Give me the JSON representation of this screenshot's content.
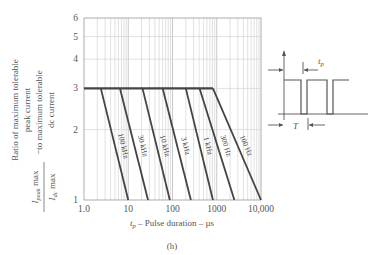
{
  "chart_data": {
    "type": "line",
    "title": "",
    "caption": "(h)",
    "xlabel": "t_p – Pulse duration – µs",
    "ylabel": "Ratio of maximum tolerable peak current to maximum tolerable dc current",
    "ylabel_formula": {
      "numerator": "I_peak max",
      "denominator": "I_dc max"
    },
    "xscale": "log",
    "yscale": "log",
    "xlim": [
      1.0,
      10000
    ],
    "ylim": [
      1,
      6
    ],
    "x_ticks": [
      "1.0",
      "10",
      "100",
      "1000",
      "10,000"
    ],
    "y_ticks": [
      "1",
      "2",
      "3",
      "4",
      "5",
      "6"
    ],
    "grid": true,
    "plateau_ratio": 3,
    "series": [
      {
        "name": "100 kHz",
        "points": [
          [
            1.0,
            3
          ],
          [
            2.4,
            3
          ],
          [
            10,
            1
          ]
        ]
      },
      {
        "name": "30 kHz",
        "points": [
          [
            1.0,
            3
          ],
          [
            6.5,
            3
          ],
          [
            28,
            1
          ]
        ]
      },
      {
        "name": "10 kHz",
        "points": [
          [
            1.0,
            3
          ],
          [
            21,
            3
          ],
          [
            87,
            1
          ]
        ]
      },
      {
        "name": "3 kHz",
        "points": [
          [
            1.0,
            3
          ],
          [
            60,
            3
          ],
          [
            260,
            1
          ]
        ]
      },
      {
        "name": "1 kHz",
        "points": [
          [
            1.0,
            3
          ],
          [
            200,
            3
          ],
          [
            820,
            1
          ]
        ]
      },
      {
        "name": "300 Hz",
        "points": [
          [
            1.0,
            3
          ],
          [
            410,
            3
          ],
          [
            2500,
            1
          ]
        ]
      },
      {
        "name": "100 Hz",
        "points": [
          [
            1.0,
            3
          ],
          [
            820,
            3
          ],
          [
            10000,
            1
          ]
        ]
      }
    ]
  },
  "inset": {
    "label_tp": "t_p",
    "label_T": "T",
    "description": "Rectangular pulse train with pulse width t_p and period T"
  },
  "labels": {
    "ylabel_line1": "Ratio of maximum tolerable",
    "ylabel_line2": "peak current",
    "ylabel_line3": "to maximum tolerable",
    "ylabel_line4": "dc current",
    "num": "I",
    "num_sub": "peak",
    "num_tail": " max",
    "den": "I",
    "den_sub": "dc",
    "den_tail": " max",
    "dash": "–",
    "x_t": "t",
    "x_sub": "p",
    "x_rest": " – Pulse duration – µs",
    "caption": "(h)",
    "tp": "t",
    "tp_sub": "p",
    "T": "T"
  },
  "colors": {
    "curve": "#444444",
    "grid": "#cccccc",
    "axis": "#888888",
    "text": "#555555"
  }
}
